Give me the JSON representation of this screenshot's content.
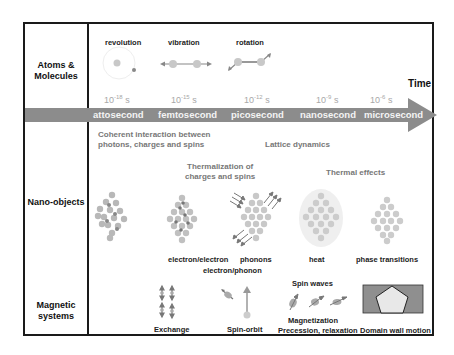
{
  "rows": [
    {
      "label_line1": "Atoms &",
      "label_line2": "Molecules"
    },
    {
      "label_line1": "Nano-objects"
    },
    {
      "label_line1": "Magnetic",
      "label_line2": "systems"
    }
  ],
  "timeline": {
    "axis_label": "Time",
    "arrow_color": "#8c8c8c",
    "values": [
      {
        "base": "10",
        "exp": "-18",
        "unit": "s"
      },
      {
        "base": "10",
        "exp": "-15",
        "unit": "s"
      },
      {
        "base": "10",
        "exp": "-12",
        "unit": "s"
      },
      {
        "base": "10",
        "exp": "-9",
        "unit": "s"
      },
      {
        "base": "10",
        "exp": "-6",
        "unit": "s"
      }
    ],
    "units": [
      "attosecond",
      "femtosecond",
      "picosecond",
      "nanosecond",
      "microsecond"
    ]
  },
  "atoms": {
    "revolution": "revolution",
    "vibration": "vibration",
    "rotation": "rotation"
  },
  "processes": {
    "coherent_line1": "Coherent interaction between",
    "coherent_line2": "photons, charges and spins",
    "lattice": "Lattice dynamics",
    "thermalization_line1": "Thermalization of",
    "thermalization_line2": "charges and spins",
    "thermal_effects": "Thermal effects"
  },
  "nano": {
    "electron_electron": "electron/electron",
    "electron_phonon": "electron/phonon",
    "phonons": "phonons",
    "heat": "heat",
    "phase_transitions": "phase transitions"
  },
  "magnetic": {
    "exchange": "Exchange",
    "spin_orbit": "Spin-orbit",
    "spin_waves": "Spin waves",
    "magnetization_line1": "Magnetization",
    "magnetization_line2": "Precession, relaxation",
    "domain_wall": "Domain wall motion"
  }
}
